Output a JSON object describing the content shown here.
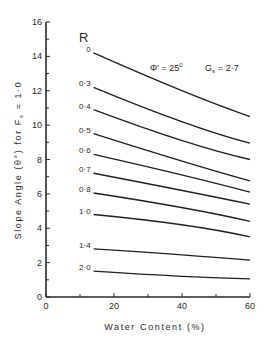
{
  "chart_data": {
    "type": "line",
    "title": "",
    "xlabel": "Water Content (%)",
    "ylabel": "Slope Angle (θ°) for Fs = 1·0",
    "xlim": [
      0,
      60
    ],
    "ylim": [
      0,
      16
    ],
    "x_ticks": [
      0,
      20,
      40,
      60
    ],
    "x_minor_ticks": [
      10,
      30,
      50
    ],
    "y_ticks": [
      0,
      2,
      4,
      6,
      8,
      10,
      12,
      14,
      16
    ],
    "y_minor_ticks": [
      1,
      3,
      5,
      7,
      9,
      11,
      13,
      15
    ],
    "grid": false,
    "legend_title": "R",
    "annotations": [
      "Φ' = 25°",
      "Gs = 2·7"
    ],
    "x": [
      14,
      40,
      60
    ],
    "series": [
      {
        "name": "0",
        "values": [
          14.2,
          12.0,
          10.5
        ]
      },
      {
        "name": "0·3",
        "values": [
          12.2,
          10.2,
          8.95
        ]
      },
      {
        "name": "0·4",
        "values": [
          10.9,
          9.1,
          8.0
        ]
      },
      {
        "name": "0·5",
        "values": [
          9.5,
          7.9,
          6.75
        ]
      },
      {
        "name": "0·6",
        "values": [
          8.3,
          7.1,
          6.1
        ]
      },
      {
        "name": "0·7",
        "values": [
          7.2,
          6.2,
          5.4
        ]
      },
      {
        "name": "0·8",
        "values": [
          6.05,
          5.2,
          4.4
        ]
      },
      {
        "name": "1·0",
        "values": [
          4.8,
          4.2,
          3.5
        ]
      },
      {
        "name": "1·4",
        "values": [
          2.8,
          2.45,
          2.15
        ]
      },
      {
        "name": "2·0",
        "values": [
          1.5,
          1.2,
          1.05
        ]
      }
    ]
  },
  "labels": {
    "legend_title": "R",
    "phi": "Φ' = 25",
    "phi_sup": "0",
    "gs_main": "G",
    "gs_sub": "s",
    "gs_value": "= 2·7",
    "ylabel_part1": "Slope  Angle  (θ°)    for  F",
    "ylabel_sub": "s",
    "ylabel_part2": " = 1·0",
    "xlabel": "Water  Content  (%)"
  }
}
